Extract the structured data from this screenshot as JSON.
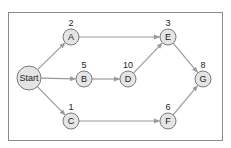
{
  "diagram": {
    "title": "",
    "colors": {
      "frame": "#8a8a8a",
      "node_fill": "#e4e4e4",
      "node_stroke": "#7a7a7a",
      "edge": "#9a9a9a",
      "text": "#222222"
    },
    "nodes": [
      {
        "id": "Start",
        "label": "Start",
        "duration": "",
        "x": 29,
        "y": 78,
        "r": 12
      },
      {
        "id": "A",
        "label": "A",
        "duration": "2",
        "x": 71,
        "y": 37,
        "r": 8
      },
      {
        "id": "B",
        "label": "B",
        "duration": "5",
        "x": 84,
        "y": 79,
        "r": 8
      },
      {
        "id": "C",
        "label": "C",
        "duration": "1",
        "x": 71,
        "y": 121,
        "r": 8
      },
      {
        "id": "D",
        "label": "D",
        "duration": "10",
        "x": 128,
        "y": 79,
        "r": 8
      },
      {
        "id": "E",
        "label": "E",
        "duration": "3",
        "x": 168,
        "y": 37,
        "r": 8
      },
      {
        "id": "F",
        "label": "F",
        "duration": "6",
        "x": 168,
        "y": 121,
        "r": 8
      },
      {
        "id": "G",
        "label": "G",
        "duration": "8",
        "x": 203,
        "y": 79,
        "r": 8
      }
    ],
    "edges": [
      {
        "from": "Start",
        "to": "A"
      },
      {
        "from": "Start",
        "to": "B"
      },
      {
        "from": "Start",
        "to": "C"
      },
      {
        "from": "A",
        "to": "E"
      },
      {
        "from": "B",
        "to": "D"
      },
      {
        "from": "D",
        "to": "E"
      },
      {
        "from": "C",
        "to": "F"
      },
      {
        "from": "E",
        "to": "G"
      },
      {
        "from": "F",
        "to": "G"
      }
    ]
  }
}
